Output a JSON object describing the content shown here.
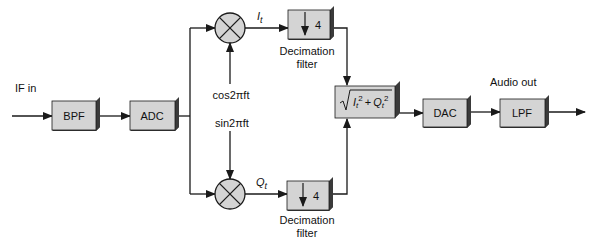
{
  "diagram": {
    "input_label": "IF in",
    "output_label": "Audio out",
    "blocks": {
      "bpf": "BPF",
      "adc": "ADC",
      "dac": "DAC",
      "lpf": "LPF",
      "decim_upper_factor": "4",
      "decim_lower_factor": "4",
      "decim_label_line1": "Decimation",
      "decim_label_line2": "filter"
    },
    "signals": {
      "i_label": "I",
      "i_sub": "t",
      "q_label": "Q",
      "q_sub": "t",
      "cos_label": "cos2πft",
      "sin_label": "sin2πft"
    },
    "magnitude": {
      "i": "I",
      "i_sub": "t",
      "sq": "2",
      "plus": "+",
      "q": "Q",
      "q_sub": "t",
      "sq2": "2"
    },
    "colors": {
      "block_fill": "#d4d4d4",
      "block_shadow": "#3a3a3a",
      "line": "#1a1a1a"
    }
  }
}
